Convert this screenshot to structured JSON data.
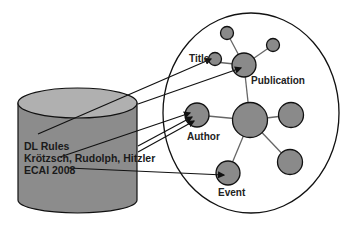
{
  "diagram": {
    "colors": {
      "background": "#ffffff",
      "node_fill": "#8a8a8a",
      "stroke": "#111111",
      "edge": "#555555",
      "cylinder_side": "#8c8c8c",
      "cylinder_top": "#b0b0b0"
    },
    "database": {
      "label_lines": [
        "DL Rules",
        "Krötzsch, Rudolph, Hitzler",
        "ECAI 2008"
      ]
    },
    "graph": {
      "nodes": [
        {
          "id": "top-small",
          "label": ""
        },
        {
          "id": "right-small",
          "label": ""
        },
        {
          "id": "title",
          "label": "Title"
        },
        {
          "id": "publication",
          "label": "Publication"
        },
        {
          "id": "author",
          "label": "Author"
        },
        {
          "id": "center",
          "label": ""
        },
        {
          "id": "right",
          "label": ""
        },
        {
          "id": "lower-right",
          "label": ""
        },
        {
          "id": "event",
          "label": "Event"
        }
      ],
      "edges": [
        [
          "publication",
          "top-small"
        ],
        [
          "publication",
          "right-small"
        ],
        [
          "publication",
          "title"
        ],
        [
          "publication",
          "center"
        ],
        [
          "center",
          "author"
        ],
        [
          "center",
          "right"
        ],
        [
          "center",
          "lower-right"
        ],
        [
          "center",
          "event"
        ]
      ]
    },
    "mappings": [
      {
        "from": "database",
        "to": "title"
      },
      {
        "from": "database",
        "to": "publication"
      },
      {
        "from": "database",
        "to": "author"
      },
      {
        "from": "database",
        "to": "author"
      },
      {
        "from": "database",
        "to": "author"
      },
      {
        "from": "database",
        "to": "event"
      }
    ]
  }
}
